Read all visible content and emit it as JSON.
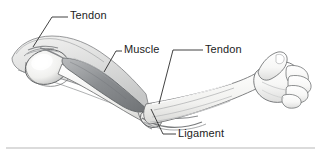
{
  "figure": {
    "style": "grayscale pencil medical illustration",
    "background_color": "#ffffff",
    "line_color": "#3a3a3a",
    "muscle_fill_color": "#8f9194",
    "bone_fill_color": "#f2f2f0",
    "skin_fill_color": "#fbfbfa",
    "shadow_color": "#c9cacb"
  },
  "labels": [
    {
      "id": "tendon-upper",
      "text": "Tendon",
      "target": "shoulder tendon",
      "text_x": 70,
      "text_y": 9,
      "leader": "M 33 47 L 52 17 L 68 17"
    },
    {
      "id": "muscle",
      "text": "Muscle",
      "target": "biceps muscle belly",
      "text_x": 124,
      "text_y": 43,
      "leader": "M 104 72 L 116 51 L 122 51"
    },
    {
      "id": "tendon-right",
      "text": "Tendon",
      "target": "distal biceps tendon at elbow",
      "text_x": 205,
      "text_y": 43,
      "leader": "M 159 104 L 173 50 L 203 50"
    },
    {
      "id": "ligament",
      "text": "Ligament",
      "target": "elbow ligament",
      "text_x": 178,
      "text_y": 127,
      "leader": "M 151 109 L 163 134 L 176 134"
    }
  ],
  "divider": {
    "name": "bottom-rule",
    "x_start": 6,
    "x_end": 315,
    "y": 148,
    "color": "#b7b7b7"
  }
}
